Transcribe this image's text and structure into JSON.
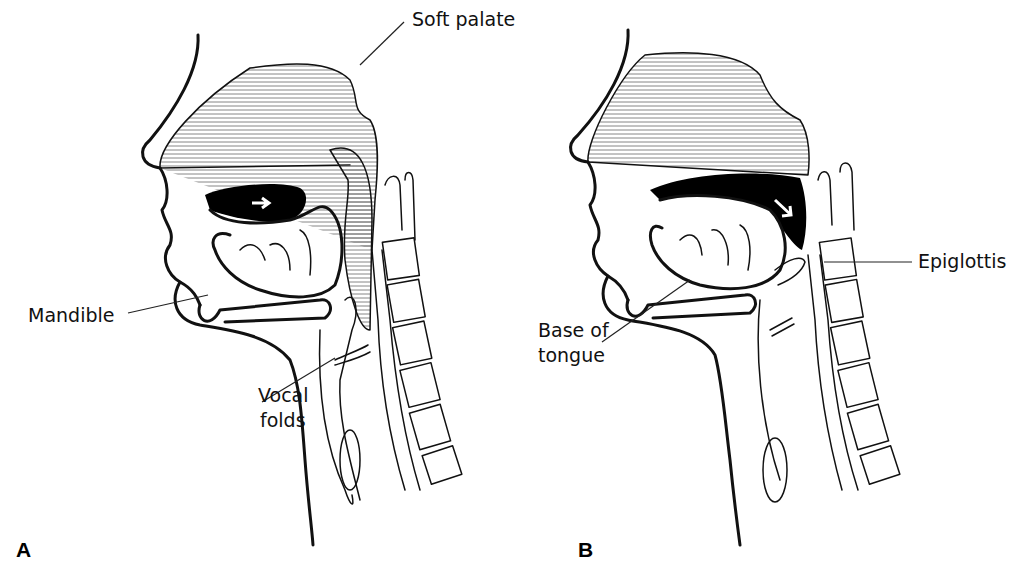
{
  "figure": {
    "panels": [
      {
        "id": "A",
        "letter": "A",
        "labels": {
          "soft_palate": "Soft palate",
          "mandible": "Mandible",
          "vocal_folds_line1": "Vocal",
          "vocal_folds_line2": "folds"
        },
        "arrow_direction": "horizontal-right"
      },
      {
        "id": "B",
        "letter": "B",
        "labels": {
          "epiglottis": "Epiglottis",
          "base_of_tongue_line1": "Base of",
          "base_of_tongue_line2": "tongue"
        },
        "arrow_direction": "diagonal-down-right"
      }
    ],
    "colors": {
      "ink": "#111111",
      "background": "#ffffff",
      "cavity_fill": "#000000",
      "hatch": "#555555"
    }
  }
}
